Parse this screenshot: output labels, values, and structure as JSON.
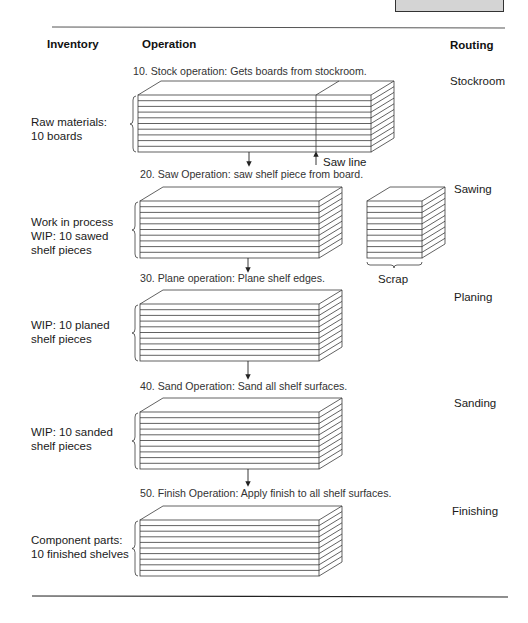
{
  "headers": {
    "inventory": "Inventory",
    "operation": "Operation",
    "routing": "Routing"
  },
  "steps": [
    {
      "operation": "10. Stock operation: Gets boards from stockroom.",
      "inventory": "Raw materials:\n10 boards",
      "routing": "Stockroom"
    },
    {
      "operation": "20. Saw Operation: saw shelf piece from board.",
      "inventory": "Work in process\nWIP: 10 sawed\nshelf pieces",
      "routing": "Sawing"
    },
    {
      "operation": "30. Plane operation: Plane shelf edges.",
      "inventory": "WIP: 10 planed\nshelf pieces",
      "routing": "Planing"
    },
    {
      "operation": "40. Sand Operation: Sand all shelf surfaces.",
      "inventory": "WIP: 10 sanded\nshelf pieces",
      "routing": "Sanding"
    },
    {
      "operation": "50. Finish Operation: Apply finish to all shelf surfaces.",
      "inventory": "Component parts:\n10 finished shelves",
      "routing": "Finishing"
    }
  ],
  "annotations": {
    "saw_line": "Saw line",
    "scrap": "Scrap"
  },
  "colors": {
    "line": "#3a3a3a",
    "rule": "#333333",
    "corner_box_fill": "#d4d4d4"
  }
}
